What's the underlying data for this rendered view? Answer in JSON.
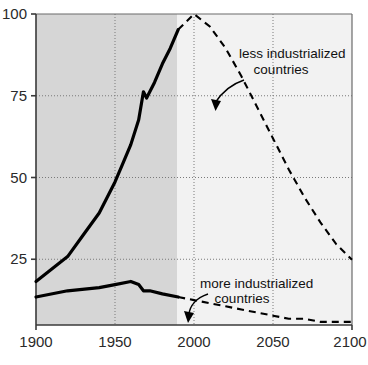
{
  "chart_data": {
    "type": "line",
    "title": "",
    "subtitle": "",
    "xlabel": "",
    "ylabel": "",
    "xlim": [
      1900,
      2100
    ],
    "ylim": [
      0,
      100
    ],
    "xticks": [
      1900,
      1950,
      2000,
      2050,
      2100
    ],
    "yticks": [
      25,
      50,
      75,
      100
    ],
    "xtick_labels": [
      "1900",
      "1950",
      "2000",
      "2050",
      "2100"
    ],
    "ytick_labels": [
      "25",
      "50",
      "75",
      "100"
    ],
    "grid": "dotted gridlines at y=25,50,75 and x=1950,2000,2050",
    "legend_position": "inline annotations with leader arrows",
    "shading": {
      "historical_fill": "#d6d6d6",
      "historical_range": [
        1900,
        1990
      ],
      "projection_fill": "#f2f2f2",
      "projection_range": [
        1990,
        2100
      ]
    },
    "series": [
      {
        "name": "less industrialized countries",
        "style_historical": "solid",
        "style_projection": "dashed",
        "x": [
          1900,
          1910,
          1920,
          1930,
          1940,
          1950,
          1955,
          1960,
          1965,
          1968,
          1970,
          1975,
          1980,
          1985,
          1990,
          2000,
          2010,
          2020,
          2030,
          2040,
          2050,
          2060,
          2070,
          2080,
          2090,
          2100
        ],
        "values": [
          14,
          18,
          22,
          29,
          36,
          46,
          52,
          58,
          66,
          75,
          73,
          78,
          84,
          89,
          95,
          100,
          96,
          89,
          80,
          70,
          60,
          50,
          41,
          33,
          26,
          21
        ]
      },
      {
        "name": "more industrialized countries",
        "style_historical": "solid",
        "style_projection": "dashed",
        "x": [
          1900,
          1920,
          1940,
          1950,
          1960,
          1965,
          1968,
          1972,
          1980,
          1990,
          2000,
          2010,
          2020,
          2030,
          2040,
          2050,
          2060,
          2070,
          2080,
          2090,
          2100
        ],
        "values": [
          9,
          11,
          12,
          13,
          14,
          13,
          11,
          11,
          10,
          9,
          8,
          7,
          6,
          5,
          4,
          3,
          2,
          2,
          1,
          1,
          1
        ]
      }
    ],
    "annotations": [
      {
        "id": "less-industrialized",
        "line1": "less industrialized",
        "line2": "countries",
        "points_to_series": "less industrialized countries",
        "arrow": "curved leader pointing down-left to the dashed descending curve near 2010"
      },
      {
        "id": "more-industrialized",
        "line1": "more industrialized",
        "line2": "countries",
        "points_to_series": "more industrialized countries",
        "arrow": "curved leader pointing down-left to the dashed lower curve near 2000"
      }
    ],
    "colors": {
      "line": "#000000",
      "axis": "#3a3a3a",
      "grid": "#7a7a7a",
      "historical_band": "#d6d6d6",
      "projection_band": "#f2f2f2",
      "text": "#111111"
    }
  }
}
